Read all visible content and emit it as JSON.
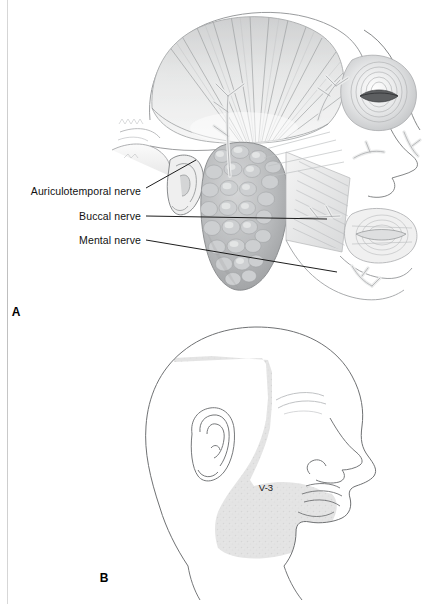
{
  "figure": {
    "panels": [
      {
        "id": "A",
        "letter": "A",
        "x": 16,
        "y": 312,
        "description": "lateral-head-dissection-trigeminal-v3-branches"
      },
      {
        "id": "B",
        "letter": "B",
        "x": 104,
        "y": 578,
        "description": "lateral-head-outline-v3-sensory-distribution"
      }
    ],
    "labels": [
      {
        "name": "auriculotemporal-nerve",
        "text": "Auriculotemporal nerve",
        "text_x": 141,
        "text_y": 191,
        "leader": {
          "x1": 146,
          "y1": 188,
          "x2": 196,
          "y2": 160
        }
      },
      {
        "name": "buccal-nerve",
        "text": "Buccal nerve",
        "text_x": 141,
        "text_y": 216,
        "leader": {
          "x1": 146,
          "y1": 216,
          "x2": 327,
          "y2": 219
        }
      },
      {
        "name": "mental-nerve",
        "text": "Mental nerve",
        "text_x": 141,
        "text_y": 240,
        "leader": {
          "x1": 146,
          "y1": 240,
          "x2": 337,
          "y2": 272
        }
      }
    ],
    "region_label": {
      "name": "v3-distribution",
      "text": "V-3",
      "x": 266,
      "y": 487
    },
    "caption": ""
  },
  "colors": {
    "ink": "#1a1a1a",
    "outline": "#55575a",
    "shade_region": "#e2e2e2",
    "parotid": "#b9bbbd",
    "muscle_light": "#efefef",
    "muscle_mid": "#c9cacb",
    "muscle_dark": "#8e9092",
    "page_edge": "#c9c9c9",
    "background": "#ffffff"
  }
}
